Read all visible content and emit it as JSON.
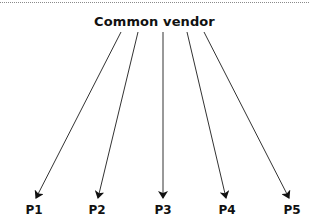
{
  "diagram": {
    "source": {
      "label": "Common vendor"
    },
    "targets": [
      {
        "label": "P1"
      },
      {
        "label": "P2"
      },
      {
        "label": "P3"
      },
      {
        "label": "P4"
      },
      {
        "label": "P5"
      }
    ],
    "edges": [
      {
        "from": "Common vendor",
        "to": "P1"
      },
      {
        "from": "Common vendor",
        "to": "P2"
      },
      {
        "from": "Common vendor",
        "to": "P3"
      },
      {
        "from": "Common vendor",
        "to": "P4"
      },
      {
        "from": "Common vendor",
        "to": "P5"
      }
    ],
    "colors": {
      "line": "#333333",
      "text": "#111111",
      "rule": "#8a8a8a"
    }
  }
}
